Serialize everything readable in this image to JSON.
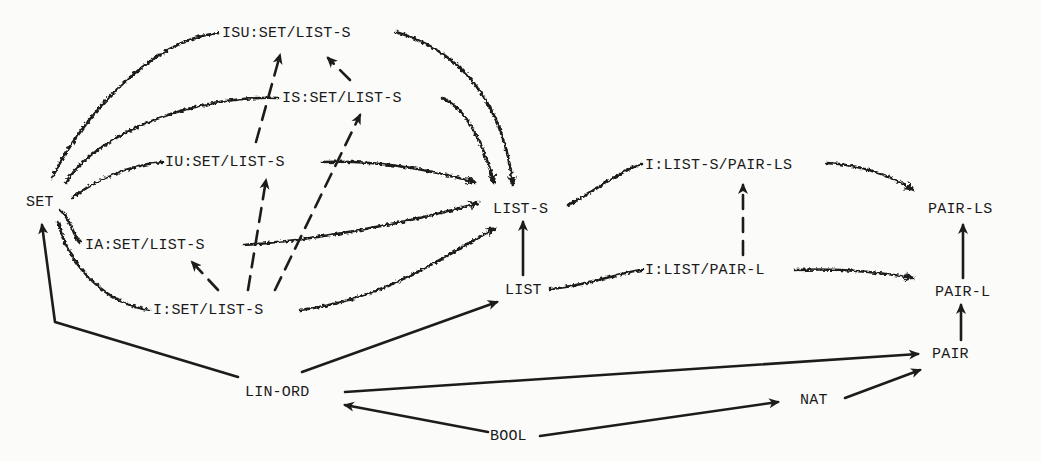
{
  "diagram": {
    "type": "specification-hierarchy",
    "nodes": [
      {
        "id": "isu",
        "label": "ISU:SET/LIST-S",
        "x": 222,
        "y": 26
      },
      {
        "id": "is",
        "label": "IS:SET/LIST-S",
        "x": 282,
        "y": 91
      },
      {
        "id": "iu",
        "label": "IU:SET/LIST-S",
        "x": 165,
        "y": 155
      },
      {
        "id": "set",
        "label": "SET",
        "x": 26,
        "y": 195
      },
      {
        "id": "lists",
        "label": "LIST-S",
        "x": 493,
        "y": 202
      },
      {
        "id": "ia",
        "label": "IA:SET/LIST-S",
        "x": 85,
        "y": 238
      },
      {
        "id": "i",
        "label": "I:SET/LIST-S",
        "x": 153,
        "y": 303
      },
      {
        "id": "list",
        "label": "LIST",
        "x": 505,
        "y": 283
      },
      {
        "id": "ilsp",
        "label": "I:LIST-S/PAIR-LS",
        "x": 645,
        "y": 158
      },
      {
        "id": "ilp",
        "label": "I:LIST/PAIR-L",
        "x": 645,
        "y": 263
      },
      {
        "id": "pairls",
        "label": "PAIR-LS",
        "x": 928,
        "y": 202
      },
      {
        "id": "pairl",
        "label": "PAIR-L",
        "x": 935,
        "y": 285
      },
      {
        "id": "pair",
        "label": "PAIR",
        "x": 932,
        "y": 347
      },
      {
        "id": "linord",
        "label": "LIN-ORD",
        "x": 245,
        "y": 385
      },
      {
        "id": "nat",
        "label": "NAT",
        "x": 800,
        "y": 393
      },
      {
        "id": "bool",
        "label": "BOOL",
        "x": 490,
        "y": 429
      }
    ],
    "edge_styles": {
      "wavy": "implementation (wavy arrow)",
      "solid": "use / enrichment (solid arrow)",
      "dashed": "refinement (dashed arrow)"
    },
    "edges": [
      {
        "from": "set",
        "to": "isu",
        "style": "wavy"
      },
      {
        "from": "isu",
        "to": "lists",
        "style": "wavy"
      },
      {
        "from": "set",
        "to": "is",
        "style": "wavy"
      },
      {
        "from": "is",
        "to": "lists",
        "style": "wavy"
      },
      {
        "from": "set",
        "to": "iu",
        "style": "wavy"
      },
      {
        "from": "iu",
        "to": "lists",
        "style": "wavy"
      },
      {
        "from": "set",
        "to": "ia",
        "style": "wavy"
      },
      {
        "from": "ia",
        "to": "lists",
        "style": "wavy"
      },
      {
        "from": "set",
        "to": "i",
        "style": "wavy"
      },
      {
        "from": "i",
        "to": "lists",
        "style": "wavy"
      },
      {
        "from": "is",
        "to": "isu",
        "style": "dashed"
      },
      {
        "from": "iu",
        "to": "isu",
        "style": "dashed"
      },
      {
        "from": "i",
        "to": "iu",
        "style": "dashed"
      },
      {
        "from": "i",
        "to": "is",
        "style": "dashed"
      },
      {
        "from": "i",
        "to": "ia",
        "style": "dashed"
      },
      {
        "from": "list",
        "to": "lists",
        "style": "solid"
      },
      {
        "from": "lists",
        "to": "ilsp",
        "style": "wavy"
      },
      {
        "from": "ilsp",
        "to": "pairls",
        "style": "wavy"
      },
      {
        "from": "list",
        "to": "ilp",
        "style": "wavy"
      },
      {
        "from": "ilp",
        "to": "pairl",
        "style": "wavy"
      },
      {
        "from": "ilp",
        "to": "ilsp",
        "style": "dashed"
      },
      {
        "from": "pairl",
        "to": "pairls",
        "style": "solid"
      },
      {
        "from": "pair",
        "to": "pairl",
        "style": "solid"
      },
      {
        "from": "linord",
        "to": "set",
        "style": "solid"
      },
      {
        "from": "linord",
        "to": "list",
        "style": "solid"
      },
      {
        "from": "linord",
        "to": "pair",
        "style": "solid"
      },
      {
        "from": "bool",
        "to": "linord",
        "style": "solid"
      },
      {
        "from": "bool",
        "to": "nat",
        "style": "solid"
      },
      {
        "from": "nat",
        "to": "pair",
        "style": "solid"
      }
    ]
  },
  "labels": {
    "isu": "ISU:SET/LIST-S",
    "is": "IS:SET/LIST-S",
    "iu": "IU:SET/LIST-S",
    "set": "SET",
    "lists": "LIST-S",
    "ia": "IA:SET/LIST-S",
    "i": "I:SET/LIST-S",
    "list": "LIST",
    "ilsp": "I:LIST-S/PAIR-LS",
    "ilp": "I:LIST/PAIR-L",
    "pairls": "PAIR-LS",
    "pairl": "PAIR-L",
    "pair": "PAIR",
    "linord": "LIN-ORD",
    "nat": "NAT",
    "bool": "BOOL"
  }
}
